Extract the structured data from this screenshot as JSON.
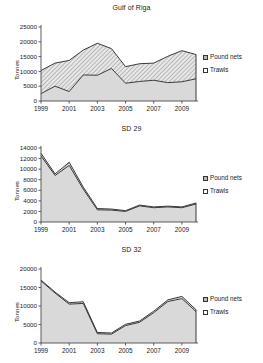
{
  "figure": {
    "ylabel": "Tonnes",
    "legend": {
      "pound_nets": "Pound nets",
      "trawls": "Trawls",
      "pound_icon": "legend-swatch-hatched",
      "trawl_icon": "legend-swatch-gray"
    },
    "colors": {
      "trawls_fill": "#d9d9d9",
      "pound_fill": "#c9c9c9",
      "line": "#3a3a3a",
      "axis": "#4a4a4a",
      "text": "#1a1a1a"
    }
  },
  "chart_data": [
    {
      "type": "area",
      "title": "Gulf of Riga",
      "xlabel": "",
      "ylabel": "Tonnes",
      "stacked": true,
      "grid": false,
      "legend_position": "right",
      "x": [
        1999,
        2000,
        2001,
        2002,
        2003,
        2004,
        2005,
        2006,
        2007,
        2008,
        2009,
        2010
      ],
      "tick_labels": [
        "1999",
        "2001",
        "2003",
        "2005",
        "2007",
        "2009"
      ],
      "ylim": [
        0,
        25000
      ],
      "yticks": [
        0,
        5000,
        10000,
        15000,
        20000,
        25000
      ],
      "series": [
        {
          "name": "Trawls",
          "values": [
            2500,
            5000,
            3200,
            8800,
            8700,
            11000,
            6000,
            6600,
            7000,
            6200,
            6500,
            7500
          ]
        },
        {
          "name": "Pound nets",
          "values": [
            7800,
            7800,
            10500,
            8400,
            10800,
            6700,
            5600,
            6000,
            5800,
            8900,
            10500,
            8200
          ]
        }
      ],
      "totals": [
        10300,
        12800,
        13700,
        17200,
        19500,
        17700,
        11600,
        12600,
        12800,
        15100,
        17000,
        15700
      ]
    },
    {
      "type": "area",
      "title": "SD 29",
      "xlabel": "",
      "ylabel": "Tonnes",
      "stacked": true,
      "grid": false,
      "legend_position": "right",
      "x": [
        1999,
        2000,
        2001,
        2002,
        2003,
        2004,
        2005,
        2006,
        2007,
        2008,
        2009,
        2010
      ],
      "tick_labels": [
        "1999",
        "2001",
        "2003",
        "2005",
        "2007",
        "2009"
      ],
      "ylim": [
        0,
        14000
      ],
      "yticks": [
        0,
        2000,
        4000,
        6000,
        8000,
        10000,
        12000,
        14000
      ],
      "series": [
        {
          "name": "Trawls",
          "values": [
            12500,
            8800,
            10700,
            6200,
            2300,
            2250,
            2000,
            3050,
            2700,
            2850,
            2700,
            3400
          ]
        },
        {
          "name": "Pound nets",
          "values": [
            500,
            300,
            600,
            400,
            250,
            200,
            150,
            150,
            150,
            150,
            150,
            200
          ]
        }
      ],
      "totals": [
        13000,
        9100,
        11300,
        6600,
        2550,
        2450,
        2150,
        3200,
        2850,
        3000,
        2850,
        3600
      ]
    },
    {
      "type": "area",
      "title": "SD 32",
      "xlabel": "",
      "ylabel": "Tonnes",
      "stacked": true,
      "grid": false,
      "legend_position": "right",
      "x": [
        1999,
        2000,
        2001,
        2002,
        2003,
        2004,
        2005,
        2006,
        2007,
        2008,
        2009,
        2010
      ],
      "tick_labels": [
        "1999",
        "2001",
        "2003",
        "2005",
        "2007",
        "2009"
      ],
      "ylim": [
        0,
        20000
      ],
      "yticks": [
        0,
        5000,
        10000,
        15000,
        20000
      ],
      "series": [
        {
          "name": "Trawls",
          "values": [
            16800,
            13500,
            10500,
            10700,
            2500,
            2400,
            4700,
            5600,
            8200,
            11200,
            12000,
            8500
          ]
        },
        {
          "name": "Pound nets",
          "values": [
            200,
            250,
            400,
            450,
            350,
            300,
            350,
            350,
            400,
            450,
            600,
            500
          ]
        }
      ],
      "totals": [
        17000,
        13750,
        10900,
        11150,
        2850,
        2700,
        5050,
        5950,
        8600,
        11650,
        12600,
        9000
      ]
    }
  ]
}
